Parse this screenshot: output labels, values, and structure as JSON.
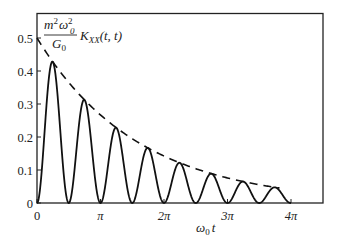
{
  "chart_data": {
    "type": "line",
    "title": "",
    "xlabel": "ω0 t",
    "ylabel": "m²ω0²/G0 · K_XX(t,t)",
    "xlim": [
      0,
      12.566
    ],
    "ylim": [
      0,
      0.5
    ],
    "grid": false,
    "legend": "none",
    "x_ticks": [
      {
        "value": 0,
        "label": "0"
      },
      {
        "value": 3.1416,
        "label": "π"
      },
      {
        "value": 6.2832,
        "label": "2π"
      },
      {
        "value": 9.4248,
        "label": "3π"
      },
      {
        "value": 12.566,
        "label": "4π"
      }
    ],
    "y_ticks": [
      {
        "value": 0,
        "label": "0"
      },
      {
        "value": 0.1,
        "label": "0.1"
      },
      {
        "value": 0.2,
        "label": "0.2"
      },
      {
        "value": 0.3,
        "label": "0.3"
      },
      {
        "value": 0.4,
        "label": "0.4"
      },
      {
        "value": 0.5,
        "label": "0.5"
      }
    ],
    "series": [
      {
        "name": "K_XX(t,t) (oscillating)",
        "style": "solid",
        "formula": "0.5*exp(-0.2*x)*sin(2x)^2",
        "peaks": [
          {
            "x_label": "π/4",
            "x": 0.785,
            "y": 0.43
          },
          {
            "x_label": "3π/4",
            "x": 2.356,
            "y": 0.31
          },
          {
            "x_label": "5π/4",
            "x": 3.927,
            "y": 0.23
          },
          {
            "x_label": "7π/4",
            "x": 5.498,
            "y": 0.17
          },
          {
            "x_label": "9π/4",
            "x": 7.069,
            "y": 0.12
          },
          {
            "x_label": "11π/4",
            "x": 8.639,
            "y": 0.09
          },
          {
            "x_label": "13π/4",
            "x": 10.21,
            "y": 0.065
          },
          {
            "x_label": "15π/4",
            "x": 11.78,
            "y": 0.047
          }
        ],
        "zeros": [
          0,
          1.571,
          3.142,
          4.712,
          6.283,
          7.854,
          9.425,
          10.996,
          12.566
        ]
      },
      {
        "name": "envelope",
        "style": "dashed",
        "formula": "0.5*exp(-0.2*x)",
        "x": [
          0,
          3.1416,
          6.2832,
          9.4248,
          12.0
        ],
        "values": [
          0.5,
          0.267,
          0.142,
          0.076,
          0.045
        ]
      }
    ],
    "annotations": [
      {
        "text": "m²ω0²/G0 K_XX(t,t)",
        "position": "top-left inside plot"
      }
    ]
  },
  "labels": {
    "y_annotation_num_m": "m",
    "y_annotation_num_sup": "2",
    "y_annotation_num_omega": "ω",
    "y_annotation_num_sub": "0",
    "y_annotation_num_sup2": "2",
    "y_annotation_den": "G",
    "y_annotation_den_sub": "0",
    "y_annotation_K": "K",
    "y_annotation_K_sub": "XX",
    "y_annotation_args": "(t, t)",
    "x_axis_omega": "ω",
    "x_axis_sub": "0",
    "x_axis_t": "t"
  }
}
